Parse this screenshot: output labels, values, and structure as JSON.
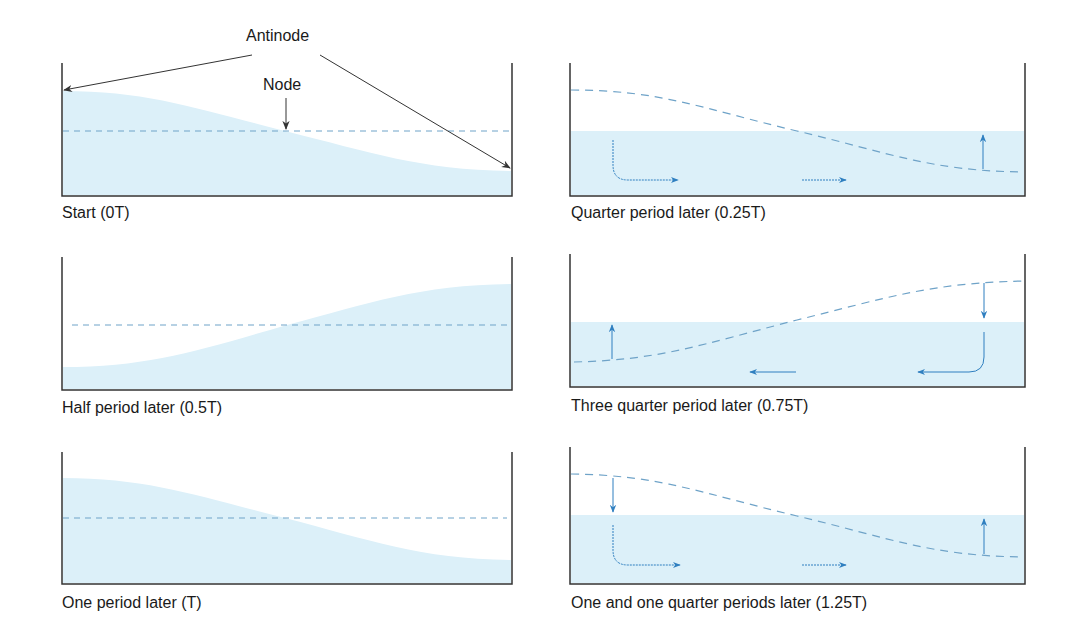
{
  "annotations": {
    "antinode": "Antinode",
    "node": "Node"
  },
  "colors": {
    "water": "#dcf0f9",
    "dashed_line": "#6fa3c8",
    "flow_arrow": "#2f7fc0",
    "tank_wall": "#333333",
    "pointer": "#333333"
  },
  "panels": [
    {
      "id": "p0",
      "label": "Start (0T)",
      "time": "0T",
      "state": "left-high"
    },
    {
      "id": "p1",
      "label": "Quarter period later (0.25T)",
      "time": "0.25T",
      "state": "flat, flow right"
    },
    {
      "id": "p2",
      "label": "Half period later (0.5T)",
      "time": "0.5T",
      "state": "right-high"
    },
    {
      "id": "p3",
      "label": "Three quarter period later (0.75T)",
      "time": "0.75T",
      "state": "flat, flow left"
    },
    {
      "id": "p4",
      "label": "One period later (T)",
      "time": "T",
      "state": "left-high"
    },
    {
      "id": "p5",
      "label": "One and one quarter periods later (1.25T)",
      "time": "1.25T",
      "state": "flat, flow right"
    }
  ]
}
